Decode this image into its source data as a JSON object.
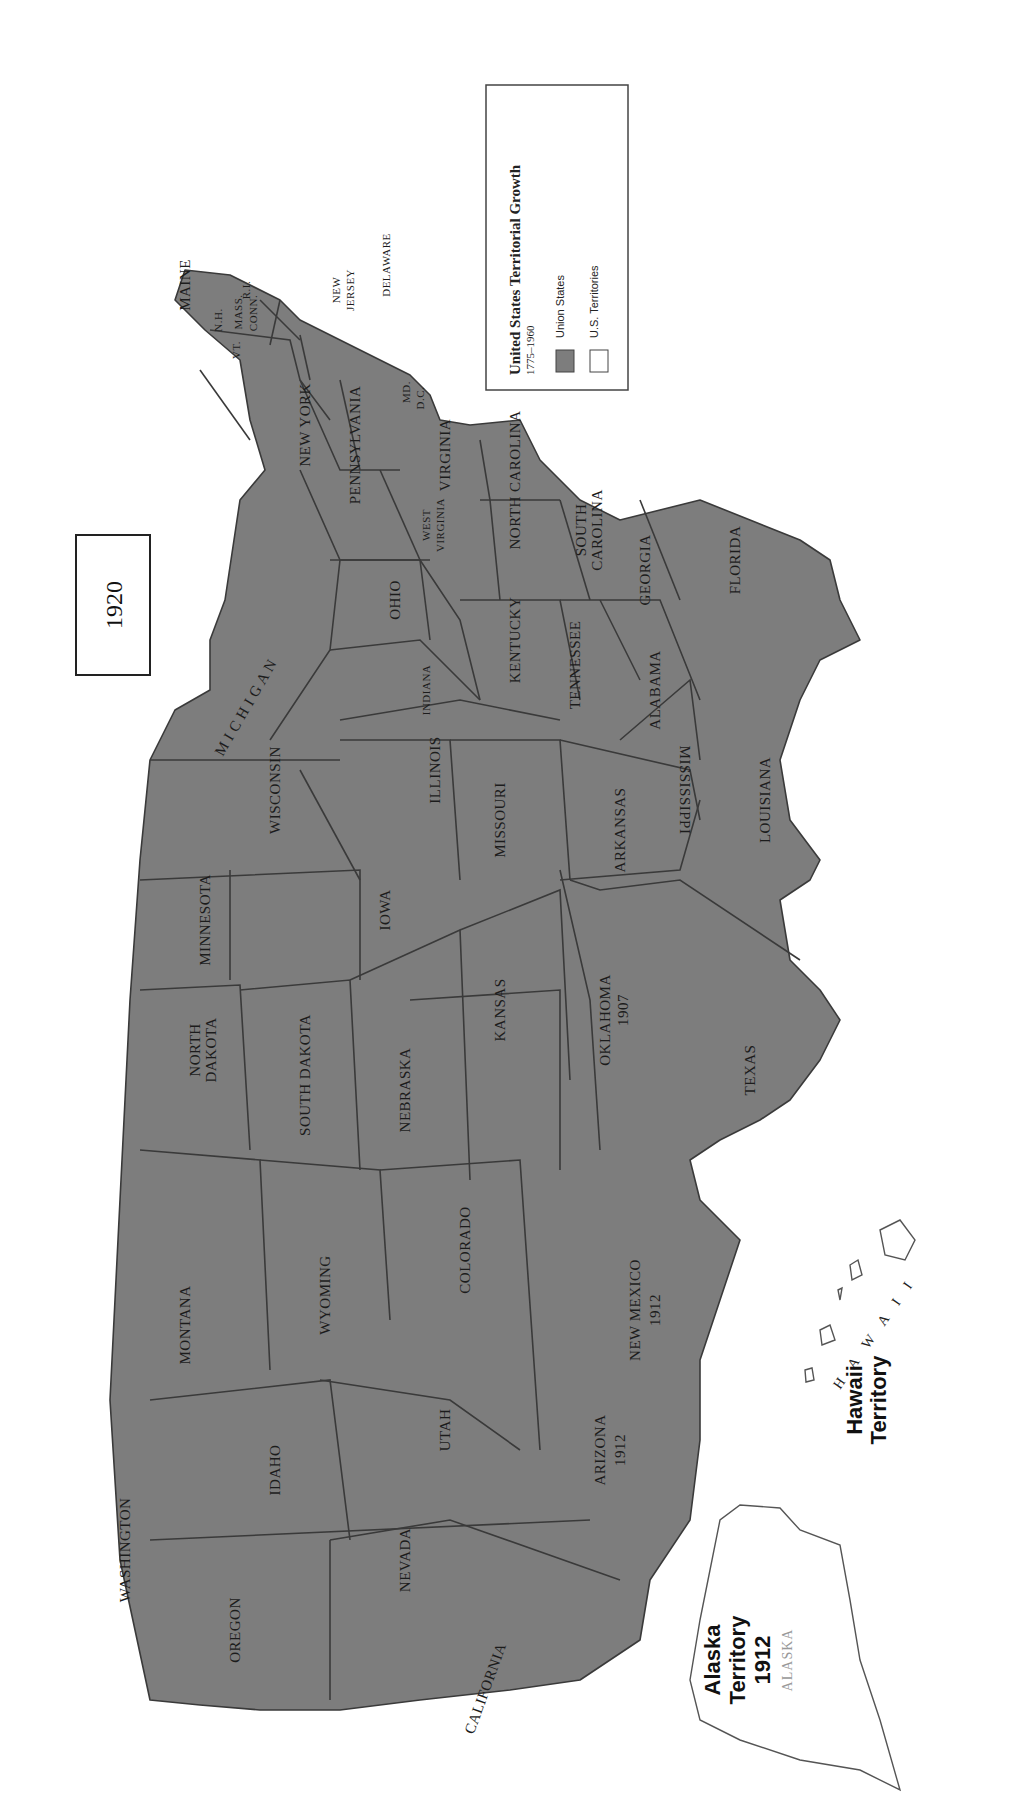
{
  "title_box": {
    "year": "1920"
  },
  "legend": {
    "title": "United States Territorial Growth",
    "subtitle": "1775–1960",
    "items": [
      {
        "label": "Union States",
        "color": "#7d7d7d"
      },
      {
        "label": "U.S. Territories",
        "color": "#ffffff"
      }
    ]
  },
  "colors": {
    "state_fill": "#7d7d7d",
    "border": "#3a3a3a",
    "background": "#ffffff"
  },
  "states": {
    "maine": "MAINE",
    "vt": "VT.",
    "nh": "N.H.",
    "mass": "MASS.",
    "conn": "CONN.",
    "ri": "R.I.",
    "new_york": "NEW YORK",
    "new_jersey_1": "NEW",
    "new_jersey_2": "JERSEY",
    "delaware": "DELAWARE",
    "pennsylvania": "PENNSYLVANIA",
    "md": "MD.",
    "dc": "D.C.",
    "virginia": "VIRGINIA",
    "west_virginia_1": "WEST",
    "west_virginia_2": "VIRGINIA",
    "north_carolina": "NORTH CAROLINA",
    "south_carolina_1": "SOUTH",
    "south_carolina_2": "CAROLINA",
    "georgia": "GEORGIA",
    "florida": "FLORIDA",
    "ohio": "OHIO",
    "kentucky": "KENTUCKY",
    "tennessee": "TENNESSEE",
    "alabama": "ALABAMA",
    "mississippi": "MISSISSIPPI",
    "michigan": "M I C H I G A N",
    "indiana": "INDIANA",
    "illinois": "ILLINOIS",
    "wisconsin": "WISCONSIN",
    "missouri": "MISSOURI",
    "arkansas": "ARKANSAS",
    "louisiana": "LOUISIANA",
    "minnesota": "MINNESOTA",
    "iowa": "IOWA",
    "kansas": "KANSAS",
    "oklahoma": "OKLAHOMA",
    "oklahoma_year": "1907",
    "texas": "TEXAS",
    "north_dakota_1": "NORTH",
    "north_dakota_2": "DAKOTA",
    "south_dakota": "SOUTH DAKOTA",
    "nebraska": "NEBRASKA",
    "colorado": "COLORADO",
    "new_mexico": "NEW MEXICO",
    "new_mexico_year": "1912",
    "montana": "MONTANA",
    "wyoming": "WYOMING",
    "utah": "UTAH",
    "arizona": "ARIZONA",
    "arizona_year": "1912",
    "idaho": "IDAHO",
    "nevada": "NEVADA",
    "washington": "WASHINGTON",
    "oregon": "OREGON",
    "california": "CALIFORNIA"
  },
  "territories": {
    "alaska": {
      "name_1": "Alaska",
      "name_2": "Territory",
      "year": "1912",
      "label": "ALASKA"
    },
    "hawaii": {
      "name_1": "Hawaii",
      "name_2": "Territory",
      "label": "H A W A I I"
    }
  }
}
